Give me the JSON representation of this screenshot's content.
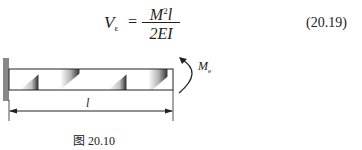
{
  "equation": {
    "lhs_symbol": "V",
    "lhs_subscript": "ε",
    "equals": "=",
    "numerator_base": "M",
    "numerator_exp": "2",
    "numerator_tail": "l",
    "denominator": "2EI",
    "number": "(20.19)"
  },
  "figure": {
    "length_label": "l",
    "moment_label": "M",
    "moment_subscript": "e",
    "caption": "图 20.10",
    "colors": {
      "line": "#222222",
      "wall": "#888888",
      "shade_dark": "#2a2a2a"
    }
  }
}
